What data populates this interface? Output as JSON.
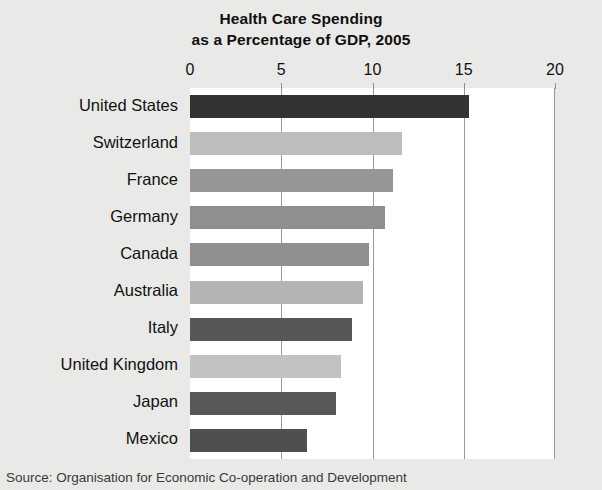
{
  "chart_data": {
    "type": "bar",
    "orientation": "horizontal",
    "title": "Health Care Spending as a Percentage of GDP, 2005",
    "title_lines": [
      "Health Care Spending",
      "as a Percentage of GDP, 2005"
    ],
    "xlabel": "",
    "ylabel": "",
    "xlim": [
      0,
      20
    ],
    "xticks": [
      0,
      5,
      10,
      15,
      20
    ],
    "xtick_labels": [
      "0",
      "5",
      "10",
      "15",
      "20"
    ],
    "grid": "vertical gridlines at 5, 10, 15",
    "legend": "none",
    "categories": [
      "United States",
      "Switzerland",
      "France",
      "Germany",
      "Canada",
      "Australia",
      "Italy",
      "United Kingdom",
      "Japan",
      "Mexico"
    ],
    "values": [
      15.3,
      11.6,
      11.1,
      10.7,
      9.8,
      9.5,
      8.9,
      8.3,
      8.0,
      6.4
    ],
    "bar_colors": [
      "#333333",
      "#bdbdbd",
      "#969696",
      "#8f8f8f",
      "#909090",
      "#b4b4b4",
      "#575757",
      "#c2c2c2",
      "#585858",
      "#4f4f4f"
    ],
    "panel_background": "#ffffff",
    "figure_background": "#e9e9e7",
    "gridline_color": "#9a9a9a",
    "text_color": "#111111"
  },
  "source": {
    "text": "Source: Organisation for Economic Co-operation and Development"
  }
}
